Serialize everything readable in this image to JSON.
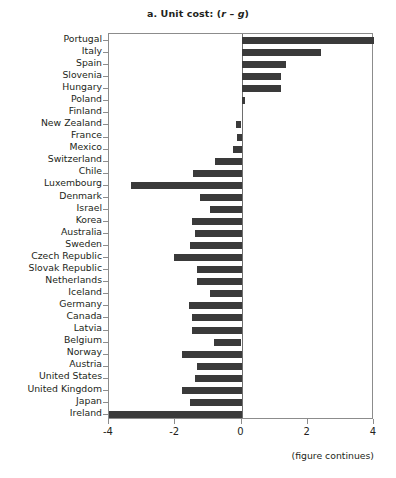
{
  "chart_data": {
    "type": "bar",
    "orientation": "horizontal",
    "title": "a. Unit cost: (r – g)",
    "title_prefix": "a. Unit cost: (",
    "title_italic_r": "r",
    "title_dash": " – ",
    "title_italic_g": "g",
    "title_suffix": ")",
    "xlabel": "",
    "ylabel": "",
    "xlim": [
      -4,
      4
    ],
    "xticks": [
      -4,
      -2,
      0,
      2,
      4
    ],
    "xtick_labels": [
      "-4",
      "-2",
      "0",
      "2",
      "4"
    ],
    "grid": false,
    "legend": false,
    "bar_color": "#3a3a3a",
    "axis_color": "#8c8c8c",
    "note": "(figure continues)",
    "categories": [
      "Portugal",
      "Italy",
      "Spain",
      "Slovenia",
      "Hungary",
      "Poland",
      "Finland",
      "New Zealand",
      "France",
      "Mexico",
      "Switzerland",
      "Chile",
      "Luxembourg",
      "Denmark",
      "Israel",
      "Korea",
      "Australia",
      "Sweden",
      "Czech Republic",
      "Slovak Republic",
      "Netherlands",
      "Iceland",
      "Germany",
      "Canada",
      "Latvia",
      "Belgium",
      "Norway",
      "Austria",
      "United States",
      "United Kingdom",
      "Japan",
      "Ireland"
    ],
    "values": [
      4.0,
      2.4,
      1.35,
      1.2,
      1.2,
      0.12,
      0.0,
      -0.17,
      -0.15,
      -0.25,
      -0.8,
      -1.45,
      -3.35,
      -1.25,
      -0.95,
      -1.5,
      -1.4,
      -1.55,
      -2.05,
      -1.35,
      -1.35,
      -0.95,
      -1.6,
      -1.5,
      -1.5,
      -0.82,
      -1.8,
      -1.35,
      -1.4,
      -1.8,
      -1.55,
      -4.0
    ]
  }
}
